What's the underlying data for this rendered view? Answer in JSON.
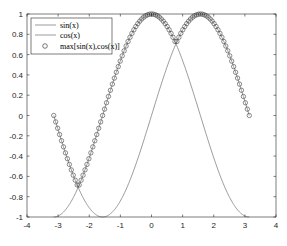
{
  "chart_data": {
    "type": "line",
    "title": "",
    "xlabel": "",
    "ylabel": "",
    "xlim": [
      -4,
      4
    ],
    "ylim": [
      -1,
      1
    ],
    "xticks": [
      "-4",
      "-3",
      "-2",
      "-1",
      "0",
      "1",
      "2",
      "3",
      "4"
    ],
    "yticks": [
      "1",
      "0.8",
      "0.6",
      "0.4",
      "0.2",
      "0",
      "-0.2",
      "-0.4",
      "-0.6",
      "-0.8",
      "-1"
    ],
    "grid": false,
    "legend_position": "upper-left",
    "x_range": [
      -3.14159,
      3.14159
    ],
    "series": [
      {
        "name": "sin(x)",
        "style": "line",
        "color": "#808080",
        "function": "sin(x)"
      },
      {
        "name": "cos(x)",
        "style": "line",
        "color": "#808080",
        "function": "cos(x)"
      },
      {
        "name": "max[sin(x),cos(x)]",
        "style": "markers-o",
        "color": "#404040",
        "function": "max(sin(x),cos(x))"
      }
    ]
  },
  "legend": {
    "items": [
      "sin(x)",
      "cos(x)",
      "max[sin(x),cos(x)]"
    ]
  }
}
